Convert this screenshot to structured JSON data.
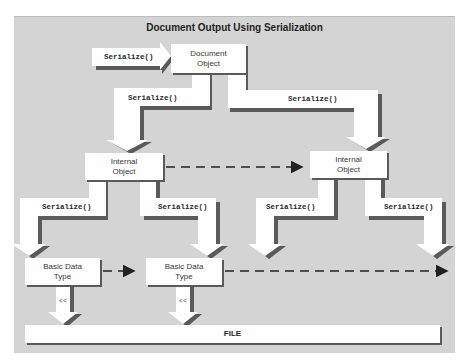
{
  "diagram": {
    "title": "Document Output Using Serialization",
    "input_call": "Serialize()",
    "nodes": {
      "document": "Document\nObject",
      "internal_left": "Internal\nObject",
      "internal_right": "Internal\nObject",
      "basic_left": "Basic Data\nType",
      "basic_middle": "Basic Data\nType",
      "file": "FILE"
    },
    "edges": {
      "doc_to_internal_left": "Serialize()",
      "doc_to_internal_right": "Serialize()",
      "internal_left_to_basic_left": "Serialize()",
      "internal_left_to_basic_middle": "Serialize()",
      "internal_right_left": "Serialize()",
      "internal_right_right": "Serialize()",
      "basic_left_to_file": "<<",
      "basic_middle_to_file": "<<"
    },
    "colors": {
      "panel": "#d4d4d4",
      "arrow_fill": "#ffffff",
      "shadow": "#5a5a5a",
      "dashed": "#222222"
    }
  }
}
